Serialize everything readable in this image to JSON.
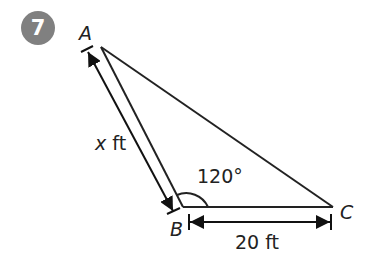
{
  "problem": {
    "number": "7",
    "badge_color": "#808080"
  },
  "triangle": {
    "vertices": {
      "A": {
        "label": "A"
      },
      "B": {
        "label": "B"
      },
      "C": {
        "label": "C"
      }
    },
    "angle_B": "120°",
    "side_AB": {
      "var": "x",
      "unit": " ft"
    },
    "side_BC": "20 ft"
  }
}
